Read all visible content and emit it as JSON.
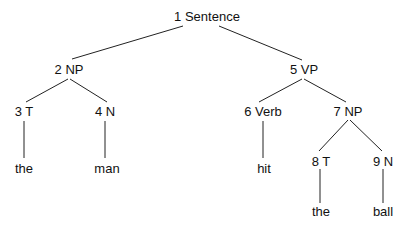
{
  "diagram": {
    "type": "parse-tree",
    "nodes": [
      {
        "id": 1,
        "label": "1 Sentence",
        "x": 207,
        "y": 10
      },
      {
        "id": 2,
        "label": "2 NP",
        "x": 69,
        "y": 63
      },
      {
        "id": 3,
        "label": "3 T",
        "x": 24,
        "y": 105
      },
      {
        "id": 4,
        "label": "4 N",
        "x": 105,
        "y": 105
      },
      {
        "id": 5,
        "label": "5 VP",
        "x": 304,
        "y": 63
      },
      {
        "id": 6,
        "label": "6 Verb",
        "x": 263,
        "y": 105
      },
      {
        "id": 7,
        "label": "7 NP",
        "x": 348,
        "y": 105
      },
      {
        "id": 8,
        "label": "8 T",
        "x": 321,
        "y": 155
      },
      {
        "id": 9,
        "label": "9 N",
        "x": 383,
        "y": 155
      }
    ],
    "leaves": [
      {
        "parent": 3,
        "word": "the",
        "x": 24,
        "y": 162
      },
      {
        "parent": 4,
        "word": "man",
        "x": 107,
        "y": 162
      },
      {
        "parent": 6,
        "word": "hit",
        "x": 264,
        "y": 162
      },
      {
        "parent": 8,
        "word": "the",
        "x": 321,
        "y": 205
      },
      {
        "parent": 9,
        "word": "ball",
        "x": 383,
        "y": 205
      }
    ],
    "edges": [
      {
        "from": 1,
        "to": 2,
        "x1": 183,
        "y1": 26,
        "x2": 72,
        "y2": 59
      },
      {
        "from": 1,
        "to": 5,
        "x1": 219,
        "y1": 26,
        "x2": 302,
        "y2": 60
      },
      {
        "from": 2,
        "to": 3,
        "x1": 68,
        "y1": 79,
        "x2": 26,
        "y2": 102
      },
      {
        "from": 2,
        "to": 4,
        "x1": 70,
        "y1": 79,
        "x2": 107,
        "y2": 102
      },
      {
        "from": 5,
        "to": 6,
        "x1": 302,
        "y1": 79,
        "x2": 259,
        "y2": 102
      },
      {
        "from": 5,
        "to": 7,
        "x1": 304,
        "y1": 79,
        "x2": 346,
        "y2": 102
      },
      {
        "from": 3,
        "to": "the-1",
        "x1": 24,
        "y1": 121,
        "x2": 24,
        "y2": 158
      },
      {
        "from": 4,
        "to": "man",
        "x1": 105,
        "y1": 121,
        "x2": 105,
        "y2": 158
      },
      {
        "from": 6,
        "to": "hit",
        "x1": 263,
        "y1": 121,
        "x2": 263,
        "y2": 158
      },
      {
        "from": 7,
        "to": 8,
        "x1": 348,
        "y1": 120,
        "x2": 319,
        "y2": 151
      },
      {
        "from": 7,
        "to": 9,
        "x1": 350,
        "y1": 120,
        "x2": 382,
        "y2": 151
      },
      {
        "from": 8,
        "to": "the-2",
        "x1": 320,
        "y1": 169,
        "x2": 320,
        "y2": 203
      },
      {
        "from": 9,
        "to": "ball",
        "x1": 383,
        "y1": 169,
        "x2": 383,
        "y2": 203
      }
    ],
    "colors": {
      "line": "#222222",
      "text": "#111111",
      "background": "#ffffff"
    }
  }
}
